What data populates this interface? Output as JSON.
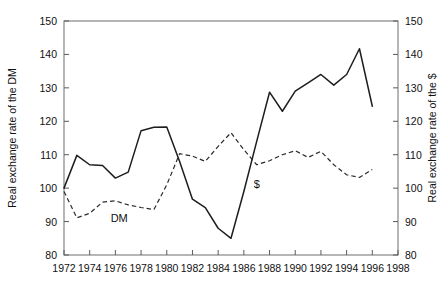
{
  "chart_data": {
    "type": "line",
    "title": "",
    "subtitle": "",
    "xlabel": "",
    "ylabel": "Real exchange rate of the DM",
    "y2label": "Real exchange rate of the $",
    "xlim": [
      1972,
      1998
    ],
    "ylim": [
      80,
      150
    ],
    "y2lim": [
      80,
      150
    ],
    "grid": false,
    "legend_position": "inline-annotation",
    "xticks": [
      1972,
      1974,
      1976,
      1978,
      1980,
      1982,
      1984,
      1986,
      1988,
      1990,
      1992,
      1994,
      1996,
      1998
    ],
    "xticklabels": [
      "1972",
      "1974",
      "1976",
      "1978",
      "1980",
      "1982",
      "1984",
      "1986",
      "1988",
      "1990",
      "1992",
      "1994",
      "1996",
      "1998"
    ],
    "xminorticks": [
      1973,
      1975,
      1977,
      1979,
      1981,
      1983,
      1985,
      1987,
      1989,
      1991,
      1993,
      1995,
      1997
    ],
    "yticks": [
      80,
      90,
      100,
      110,
      120,
      130,
      140,
      150
    ],
    "yticklabels": [
      "80",
      "90",
      "100",
      "110",
      "120",
      "130",
      "140",
      "150"
    ],
    "y2ticks": [
      80,
      90,
      100,
      110,
      120,
      130,
      140,
      150
    ],
    "y2ticklabels": [
      "80",
      "90",
      "100",
      "110",
      "120",
      "130",
      "140",
      "150"
    ],
    "x": [
      1972,
      1973,
      1974,
      1975,
      1976,
      1977,
      1978,
      1979,
      1980,
      1981,
      1982,
      1983,
      1984,
      1985,
      1986,
      1987,
      1988,
      1989,
      1990,
      1991,
      1992,
      1993,
      1994,
      1995,
      1996
    ],
    "series": [
      {
        "name": "$",
        "style": "solid",
        "color": "#1d1d1d",
        "axis": "right",
        "annotation": "$",
        "annotation_x": 1987.0,
        "annotation_y": 100.0,
        "values": [
          100.0,
          109.8,
          107.0,
          106.8,
          103.0,
          104.8,
          117.2,
          118.2,
          118.3,
          108.0,
          96.7,
          94.2,
          88.0,
          85.0,
          99.0,
          114.0,
          128.7,
          123.0,
          129.0,
          131.5,
          134.0,
          130.8,
          134.0,
          141.7,
          124.5
        ]
      },
      {
        "name": "DM",
        "style": "dashed",
        "color": "#2a2a2a",
        "axis": "left",
        "annotation": "DM",
        "annotation_x": 1976.3,
        "annotation_y": 89.8,
        "values": [
          99.0,
          91.1,
          92.5,
          95.8,
          96.2,
          95.0,
          94.2,
          93.6,
          101.0,
          110.3,
          109.6,
          108.0,
          112.5,
          116.6,
          111.5,
          107.0,
          108.2,
          110.0,
          111.2,
          109.2,
          111.0,
          107.0,
          104.0,
          103.2,
          105.6
        ]
      }
    ],
    "note_dm_extra": [
      {
        "x": 1995.0,
        "y": 99.5
      }
    ]
  },
  "annotations": {
    "dm_label": "DM",
    "dollar_label": "$"
  },
  "axes": {
    "left_title": "Real exchange rate of the DM",
    "right_title": "Real exchange rate of the $"
  }
}
